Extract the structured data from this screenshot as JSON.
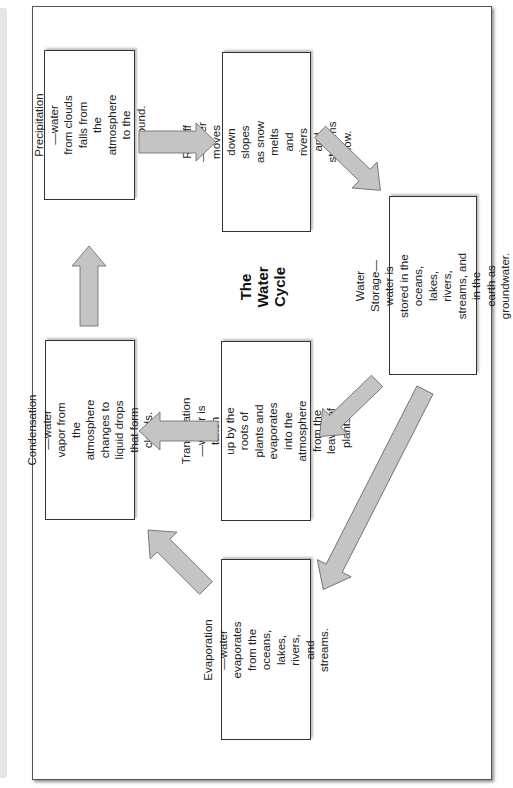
{
  "diagram": {
    "title": "The\nWater\nCycle",
    "orientation": "rotated 90° counter-clockwise",
    "arrow_color": "#c4c4c4",
    "boxes": [
      {
        "id": "precipitation",
        "text": "Precipitation—water\nfrom clouds falls from the\natmosphere to the ground."
      },
      {
        "id": "runoff",
        "text": "Runoff—water moves\ndown slopes as snow\nmelts and rivers and\nstreams flow."
      },
      {
        "id": "water-storage",
        "text": "Water Storage—water is\nstored in the oceans, lakes,\nrivers, streams, and in the\nearth as groundwater."
      },
      {
        "id": "transpiration",
        "text": "Transpiration—water is taken\nup by the roots of plants and\nevaporates into the atmosphere\nfrom the leaves of plants."
      },
      {
        "id": "evaporation",
        "text": "Evaporation—water\nevaporates from the\noceans, lakes, rivers,\nand streams."
      },
      {
        "id": "condensation",
        "text": "Condensation—water\nvapor from the atmosphere\nchanges to liquid drops\nthat form clouds."
      }
    ],
    "flows": [
      {
        "from": "precipitation",
        "to": "runoff"
      },
      {
        "from": "runoff",
        "to": "water-storage"
      },
      {
        "from": "water-storage",
        "to": "transpiration"
      },
      {
        "from": "water-storage",
        "to": "evaporation"
      },
      {
        "from": "transpiration",
        "to": "condensation"
      },
      {
        "from": "evaporation",
        "to": "condensation"
      },
      {
        "from": "condensation",
        "to": "precipitation"
      }
    ]
  }
}
